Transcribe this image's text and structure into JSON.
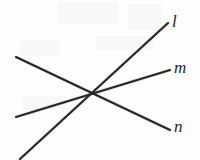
{
  "figure": {
    "canvas": {
      "width": 200,
      "height": 160,
      "background": "#fefefe"
    },
    "stroke_color": "#262626",
    "label_color": "#242424",
    "intersection": {
      "x": 93,
      "y": 95
    },
    "lines": [
      {
        "id": "l",
        "label": "l",
        "x1": 20,
        "y1": 159,
        "x2": 168,
        "y2": 23,
        "label_x": 172,
        "label_y": 13
      },
      {
        "id": "m",
        "label": "m",
        "x1": 16,
        "y1": 117,
        "x2": 170,
        "y2": 70,
        "label_x": 174,
        "label_y": 59
      },
      {
        "id": "n",
        "label": "n",
        "x1": 16,
        "y1": 57,
        "x2": 170,
        "y2": 130,
        "label_x": 174,
        "label_y": 118
      }
    ]
  }
}
